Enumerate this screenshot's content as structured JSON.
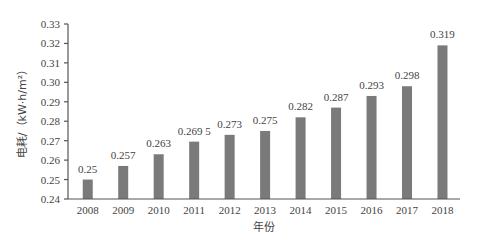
{
  "chart_data": {
    "type": "bar",
    "title": "",
    "xlabel": "年份",
    "ylabel": "电耗/（kW·h/m²）",
    "categories": [
      "2008",
      "2009",
      "2010",
      "2011",
      "2012",
      "2013",
      "2014",
      "2015",
      "2016",
      "2017",
      "2018"
    ],
    "values": [
      0.25,
      0.257,
      0.263,
      0.2695,
      0.273,
      0.275,
      0.282,
      0.287,
      0.293,
      0.298,
      0.319
    ],
    "data_labels": [
      "0.25",
      "0.257",
      "0.263",
      "0.269 5",
      "0.273",
      "0.275",
      "0.282",
      "0.287",
      "0.293",
      "0.298",
      "0.319"
    ],
    "ylim": [
      0.24,
      0.33
    ],
    "yticks": [
      "0.24",
      "0.25",
      "0.26",
      "0.27",
      "0.28",
      "0.29",
      "0.30",
      "0.31",
      "0.32",
      "0.33"
    ],
    "ytick_values": [
      0.24,
      0.25,
      0.26,
      0.27,
      0.28,
      0.29,
      0.3,
      0.31,
      0.32,
      0.33
    ],
    "grid": false,
    "legend": null,
    "bar_color": "#7a7a7a"
  }
}
